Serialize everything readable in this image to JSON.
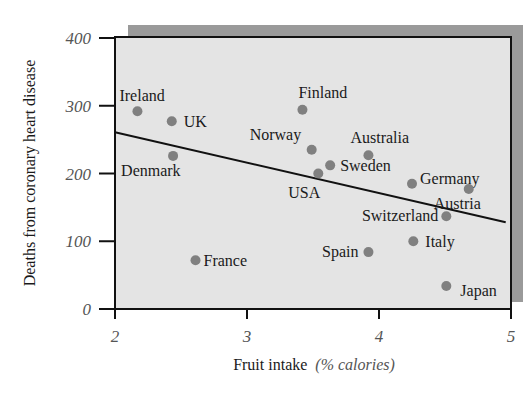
{
  "chart_data": {
    "type": "scatter",
    "title": "",
    "xlabel": "Fruit intake",
    "xlabel_unit": "(% calories)",
    "ylabel": "Deaths from coronary heart disease",
    "xlim": [
      2,
      5
    ],
    "ylim": [
      0,
      400
    ],
    "xticks": [
      "2",
      "3",
      "4",
      "5"
    ],
    "yticks": [
      "0",
      "100",
      "200",
      "300",
      "400"
    ],
    "grid": false,
    "legend": "none",
    "point_color": "#808080",
    "background_color": "#e4e4e4",
    "shadow_color": "#9a9a9a",
    "points": [
      {
        "label": "Ireland",
        "x": 2.17,
        "y": 292
      },
      {
        "label": "UK",
        "x": 2.43,
        "y": 277
      },
      {
        "label": "Denmark",
        "x": 2.44,
        "y": 226
      },
      {
        "label": "France",
        "x": 2.61,
        "y": 72
      },
      {
        "label": "Finland",
        "x": 3.42,
        "y": 294
      },
      {
        "label": "Norway",
        "x": 3.49,
        "y": 235
      },
      {
        "label": "USA",
        "x": 3.54,
        "y": 200
      },
      {
        "label": "Sweden",
        "x": 3.63,
        "y": 212
      },
      {
        "label": "Australia",
        "x": 3.92,
        "y": 227
      },
      {
        "label": "Spain",
        "x": 3.92,
        "y": 84
      },
      {
        "label": "Germany",
        "x": 4.25,
        "y": 185
      },
      {
        "label": "Italy",
        "x": 4.26,
        "y": 100
      },
      {
        "label": "Switzerland",
        "x": 4.51,
        "y": 137
      },
      {
        "label": "Japan",
        "x": 4.51,
        "y": 34
      },
      {
        "label": "Austria",
        "x": 4.68,
        "y": 177
      }
    ],
    "trend_line": {
      "x": [
        2,
        4.96
      ],
      "y": [
        261,
        128
      ]
    }
  }
}
